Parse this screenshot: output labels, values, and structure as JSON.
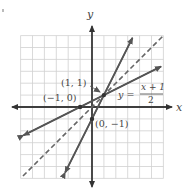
{
  "figure": {
    "type": "coordinate-graph",
    "grid": {
      "xmin": -6,
      "xmax": 6,
      "ymin": -6,
      "ymax": 6,
      "step": 1
    },
    "axes": {
      "x_label": "x",
      "y_label": "y"
    },
    "colors": {
      "grid": "#cfcfcf",
      "axis": "#333333",
      "curve": "#555555",
      "mirror_line": "#666666"
    },
    "lines": [
      {
        "name": "y = 2x - 1",
        "slope": 2,
        "intercept": -1,
        "style": "solid",
        "from": [
          -2.25,
          -5.5
        ],
        "to": [
          3.4,
          5.8
        ]
      },
      {
        "name": "y = (x + 1)/2",
        "slope": 0.5,
        "intercept": 0.5,
        "style": "solid",
        "from": [
          -5.75,
          -2.375
        ],
        "to": [
          5.8,
          3.4
        ]
      },
      {
        "name": "y = x",
        "slope": 1,
        "intercept": 0,
        "style": "dashed",
        "from": [
          -5.8,
          -5.8
        ],
        "to": [
          6.0,
          6.0
        ]
      }
    ],
    "points": [
      {
        "label": "(1, 1)",
        "x": 1,
        "y": 1
      },
      {
        "label": "(−1, 0)",
        "x": -1,
        "y": 0
      },
      {
        "label": "(0, −1)",
        "x": 0,
        "y": -1
      }
    ],
    "equation_label": {
      "lhs": "y =",
      "numerator": "x + 1",
      "denominator": "2"
    }
  }
}
